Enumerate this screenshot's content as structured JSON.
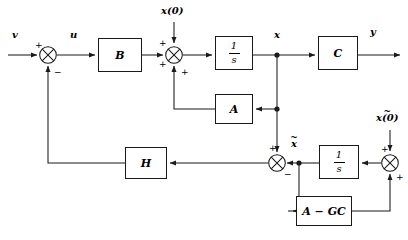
{
  "diagram": {
    "stroke_color": "#1a1a1a",
    "background": "#ffffff"
  },
  "blocks": [
    {
      "id": "B",
      "label": "B",
      "x": 98,
      "y": 38,
      "w": 44,
      "h": 34
    },
    {
      "id": "int1",
      "label": "1/s",
      "x": 215,
      "y": 36,
      "w": 38,
      "h": 34,
      "kind": "fraction",
      "numerator": "1",
      "denominator": "s"
    },
    {
      "id": "C",
      "label": "C",
      "x": 318,
      "y": 36,
      "w": 40,
      "h": 34
    },
    {
      "id": "A",
      "label": "A",
      "x": 215,
      "y": 94,
      "w": 38,
      "h": 30
    },
    {
      "id": "H",
      "label": "H",
      "x": 125,
      "y": 147,
      "w": 42,
      "h": 32
    },
    {
      "id": "int2",
      "label": "1/s",
      "x": 319,
      "y": 145,
      "w": 40,
      "h": 34,
      "kind": "fraction",
      "numerator": "1",
      "denominator": "s"
    },
    {
      "id": "AGC",
      "label": "A − GC",
      "x": 296,
      "y": 196,
      "w": 56,
      "h": 30
    }
  ],
  "summers": [
    {
      "id": "sum-input",
      "cx": 48,
      "cy": 55,
      "r": 9,
      "signs": [
        {
          "text": "+",
          "x": 35,
          "y": 41
        },
        {
          "text": "−",
          "x": 54,
          "y": 70
        }
      ]
    },
    {
      "id": "sum-plant",
      "cx": 174,
      "cy": 55,
      "r": 9,
      "signs": [
        {
          "text": "+",
          "x": 160,
          "y": 40
        },
        {
          "text": "+",
          "x": 160,
          "y": 62
        },
        {
          "text": "+",
          "x": 181,
          "y": 70
        }
      ]
    },
    {
      "id": "sum-error",
      "cx": 277,
      "cy": 163,
      "r": 9,
      "signs": [
        {
          "text": "+",
          "x": 270,
          "y": 145
        },
        {
          "text": "−",
          "x": 285,
          "y": 171
        }
      ]
    },
    {
      "id": "sum-estimator",
      "cx": 390,
      "cy": 163,
      "r": 9,
      "signs": [
        {
          "text": "+",
          "x": 382,
          "y": 146
        },
        {
          "text": "+",
          "x": 396,
          "y": 175
        }
      ]
    }
  ],
  "signal_labels": [
    {
      "id": "v",
      "text": "v",
      "x": 12,
      "y": 32,
      "tilde": false
    },
    {
      "id": "u",
      "text": "u",
      "x": 70,
      "y": 32,
      "tilde": false
    },
    {
      "id": "x0",
      "text": "x(0)",
      "x": 163,
      "y": 6,
      "tilde": false
    },
    {
      "id": "x",
      "text": "x",
      "x": 274,
      "y": 32,
      "tilde": false
    },
    {
      "id": "y",
      "text": "y",
      "x": 370,
      "y": 28,
      "tilde": false
    },
    {
      "id": "xtilde",
      "text": "x",
      "x": 292,
      "y": 139,
      "tilde": true
    },
    {
      "id": "xtilde0",
      "text": "x(0)",
      "x": 378,
      "y": 113,
      "tilde": true
    }
  ],
  "nodes": [
    {
      "id": "node-x",
      "cx": 277,
      "cy": 55,
      "r": 2.6
    },
    {
      "id": "node-a-tap",
      "cx": 277,
      "cy": 109,
      "r": 2.6
    },
    {
      "id": "node-xtilde",
      "cx": 299,
      "cy": 163,
      "r": 2.6
    }
  ]
}
